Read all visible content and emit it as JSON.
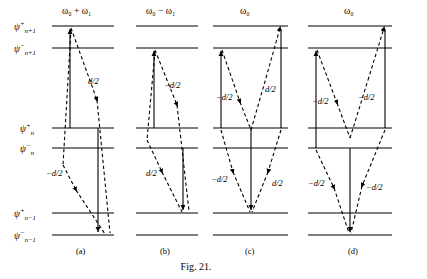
{
  "figure": {
    "caption": "Fig. 21.",
    "kind": "energy-level-transition-diagram"
  },
  "levels": {
    "labels": [
      {
        "id": "psi-plus-n-plus-1",
        "base": "ψ",
        "sup": "+",
        "sub": "n+1",
        "y": 26
      },
      {
        "id": "psi-minus-n-plus-1",
        "base": "ψ",
        "sup": "−",
        "sub": "n+1",
        "y": 48
      },
      {
        "id": "psi-plus-n",
        "base": "ψ",
        "sup": "+",
        "sub": "n",
        "y": 128
      },
      {
        "id": "psi-minus-n",
        "base": "ψ",
        "sup": "−",
        "sub": "n",
        "y": 148
      },
      {
        "id": "psi-plus-n-minus-1",
        "base": "ψ",
        "sup": "+",
        "sub": "n−1",
        "y": 213
      },
      {
        "id": "psi-minus-n-minus-1",
        "base": "ψ",
        "sup": "−",
        "sub": "n−1",
        "y": 235
      }
    ]
  },
  "panels": [
    {
      "id": "a",
      "tag": "(a)",
      "header": {
        "omega": "ω",
        "sub0": "0",
        "op": "+",
        "omega2": "ω",
        "sub1": "1"
      },
      "header_text": "ω₀ + ω₁",
      "amplitudes": [
        {
          "name": "d-over-2-upper",
          "text": "d/2",
          "x": 88,
          "y": 84
        },
        {
          "name": "minus-d-over-2-lower",
          "text": "−d/2",
          "x": 50,
          "y": 176
        }
      ]
    },
    {
      "id": "b",
      "tag": "(b)",
      "header": {
        "omega": "ω",
        "sub0": "0",
        "op": "−",
        "omega2": "ω",
        "sub1": "1"
      },
      "header_text": "ω₀ − ω₁",
      "amplitudes": [
        {
          "name": "minus-d-over-2-upper",
          "text": "−d/2",
          "x": 166,
          "y": 88
        },
        {
          "name": "d-over-2-lower",
          "text": "d/2",
          "x": 148,
          "y": 176
        }
      ]
    },
    {
      "id": "c",
      "tag": "(c)",
      "header": {
        "omega": "ω",
        "sub0": "0",
        "op": "",
        "omega2": "",
        "sub1": ""
      },
      "header_text": "ω₀",
      "amplitudes": [
        {
          "name": "minus-d-over-2-upper-left",
          "text": "−d/2",
          "x": 228,
          "y": 95
        },
        {
          "name": "d-over-2-upper-right",
          "text": "d/2",
          "x": 268,
          "y": 88
        },
        {
          "name": "minus-d-over-2-lower-left",
          "text": "−d/2",
          "x": 218,
          "y": 180
        },
        {
          "name": "d-over-2-lower-right",
          "text": "d/2",
          "x": 272,
          "y": 185
        }
      ]
    },
    {
      "id": "d",
      "tag": "(d)",
      "header": {
        "omega": "ω",
        "sub0": "0",
        "op": "",
        "omega2": "",
        "sub1": ""
      },
      "header_text": "ω₀",
      "amplitudes": [
        {
          "name": "minus-d-over-2-upper-left",
          "text": "−d/2",
          "x": 330,
          "y": 100
        },
        {
          "name": "minus-d-over-2-upper-right",
          "text": "−d/2",
          "x": 367,
          "y": 98
        },
        {
          "name": "minus-d-over-2-lower-left",
          "text": "−d/2",
          "x": 318,
          "y": 183
        },
        {
          "name": "minus-d-over-2-lower-right",
          "text": "−d/2",
          "x": 376,
          "y": 186
        }
      ]
    }
  ],
  "colors": {
    "ink": "#000000",
    "background": "#ffffff"
  }
}
